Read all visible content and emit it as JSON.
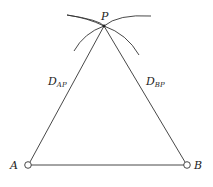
{
  "diagram": {
    "title": "",
    "points": {
      "P": {
        "label": "P",
        "x": 104,
        "y": 26
      },
      "A": {
        "label": "A",
        "x": 28,
        "y": 165
      },
      "B": {
        "label": "B",
        "x": 187,
        "y": 165
      }
    },
    "edges": [
      {
        "from": "A",
        "to": "P",
        "label_main": "D",
        "label_sub": "AP"
      },
      {
        "from": "B",
        "to": "P",
        "label_main": "D",
        "label_sub": "BP"
      },
      {
        "from": "A",
        "to": "B",
        "label_main": "",
        "label_sub": ""
      }
    ],
    "arcs": [
      {
        "name": "arc-from-A",
        "description": "arc of radius D_AP intersecting at P"
      },
      {
        "name": "arc-from-B",
        "description": "arc of radius D_BP intersecting at P"
      }
    ],
    "colors": {
      "line": "#333333",
      "background": "#ffffff"
    }
  }
}
